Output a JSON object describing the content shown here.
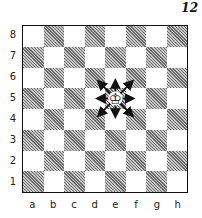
{
  "figure": {
    "number": "12"
  },
  "board": {
    "ranks": [
      "8",
      "7",
      "6",
      "5",
      "4",
      "3",
      "2",
      "1"
    ],
    "files": [
      "a",
      "b",
      "c",
      "d",
      "e",
      "f",
      "g",
      "h"
    ],
    "pieces": [
      {
        "square": "e5",
        "piece": "king",
        "color": "white"
      }
    ],
    "arrows_from": "e5",
    "arrows_to": [
      "d6",
      "e6",
      "f6",
      "d5",
      "f5",
      "d4",
      "e4",
      "f4"
    ]
  }
}
